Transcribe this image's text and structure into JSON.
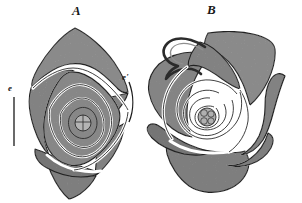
{
  "plate": {
    "background_color": "#ffffff",
    "ink_color": "#1a1a1a",
    "tissue_fill_color": "#a9a9a9",
    "tissue_fill_dark_color": "#8f8f8f",
    "outline_color": "#2b2b2b",
    "technique": "stipple engraving",
    "subject": "bud cross-sections showing vernation",
    "figures": [
      {
        "id": "A",
        "caption": "A",
        "description": "diamond-shaped bud transverse section with nested folded leaf layers",
        "center_detail": "small circle divided into segments"
      },
      {
        "id": "B",
        "caption": "B",
        "description": "irregular bud transverse section with spiralled leaf layers and two hooked tendril-like projections",
        "center_detail": "small rounded cluster of cells"
      }
    ],
    "reference_labels": [
      {
        "id": "e",
        "text": "e",
        "marker": "straight-bracket-line",
        "figure": "A",
        "side": "left"
      },
      {
        "id": "e2",
        "text": "e'",
        "marker": "curved-bracket-line",
        "figure": "A",
        "side": "right"
      }
    ]
  }
}
